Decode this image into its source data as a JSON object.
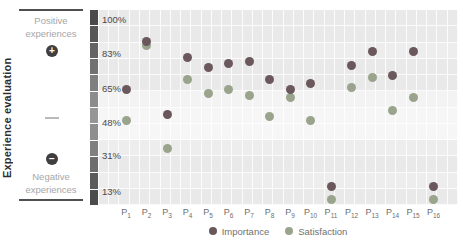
{
  "left_panel": {
    "axis_title": "Experience evaluation",
    "positive_line1": "Positive",
    "positive_line2": "experiences",
    "plus_symbol": "+",
    "minus_symbol": "−",
    "negative_line1": "Negative",
    "negative_line2": "experiences"
  },
  "strip": {
    "colors": [
      "#4a4a4a",
      "#575757",
      "#646464",
      "#717171",
      "#7f7f7f",
      "#8c8c8c",
      "#969696",
      "#8f8f8f",
      "#7f7f7f",
      "#6d6d6d",
      "#5b5b5b",
      "#4c4c4c"
    ]
  },
  "chart_data": {
    "type": "scatter",
    "title": "",
    "xlabel": "",
    "ylabel": "Experience evaluation",
    "categories": [
      "P1",
      "P2",
      "P3",
      "P4",
      "P5",
      "P6",
      "P7",
      "P8",
      "P9",
      "P10",
      "P11",
      "P12",
      "P13",
      "P14",
      "P15",
      "P16"
    ],
    "y_ticks": [
      "100%",
      "83%",
      "65%",
      "48%",
      "31%",
      "13%"
    ],
    "y_tick_values": [
      100,
      83,
      65,
      48,
      31,
      13
    ],
    "ylim": [
      6,
      105
    ],
    "grid": true,
    "legend_position": "bottom",
    "series": [
      {
        "name": "Importance",
        "color": "#6a585c",
        "values": [
          65,
          89,
          52,
          81,
          76,
          78,
          79,
          70,
          65,
          68,
          16,
          77,
          84,
          72,
          84,
          16
        ]
      },
      {
        "name": "Satisfaction",
        "color": "#9aa48c",
        "values": [
          49,
          87,
          35,
          70,
          63,
          65,
          62,
          51,
          61,
          49,
          9,
          66,
          71,
          54,
          61,
          9
        ]
      }
    ]
  }
}
